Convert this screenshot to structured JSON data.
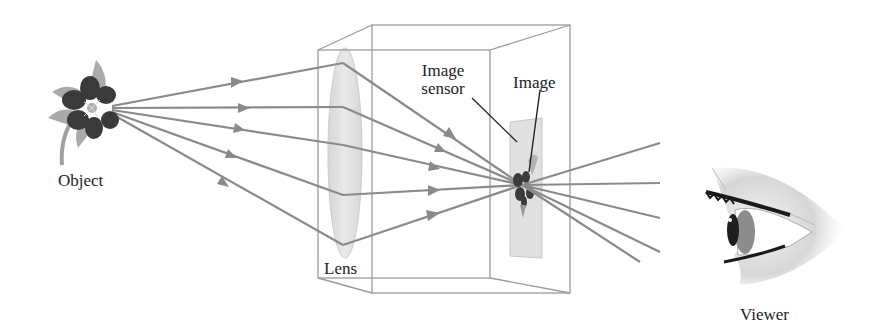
{
  "diagram": {
    "labels": {
      "object": "Object",
      "lens": "Lens",
      "image_sensor_line1": "Image",
      "image_sensor_line2": "sensor",
      "image": "Image",
      "viewer": "Viewer"
    },
    "colors": {
      "ray": "#8a8a8a",
      "box_edge": "#9a9a9a",
      "lens_fill": "#dcdcdc",
      "sensor_fill": "#e2e2e2",
      "flower_dark": "#3a3a3a",
      "flower_petal": "#a8a8a8",
      "leader_line": "#222222"
    },
    "components": [
      {
        "id": "object",
        "type": "flower",
        "position": [
          92,
          118
        ]
      },
      {
        "id": "lens",
        "type": "converging-lens",
        "center": [
          345,
          153
        ],
        "height": 210
      },
      {
        "id": "camera-box",
        "type": "box",
        "front": [
          318,
          50,
          490,
          278
        ],
        "back": [
          372,
          25,
          570,
          293
        ]
      },
      {
        "id": "image-sensor",
        "type": "plate",
        "center": [
          522,
          188
        ]
      },
      {
        "id": "image",
        "type": "inverted-flower",
        "position": [
          522,
          185
        ]
      },
      {
        "id": "viewer",
        "type": "eye",
        "position": [
          770,
          215
        ]
      }
    ],
    "rays": {
      "source": [
        112,
        108
      ],
      "lens_points": [
        [
          343,
          63
        ],
        [
          343,
          107
        ],
        [
          343,
          145
        ],
        [
          343,
          195
        ],
        [
          343,
          245
        ]
      ],
      "focus": [
        522,
        185
      ],
      "exit_points": [
        [
          660,
          143
        ],
        [
          660,
          183
        ],
        [
          660,
          218
        ],
        [
          660,
          252
        ],
        [
          640,
          262
        ]
      ]
    }
  }
}
